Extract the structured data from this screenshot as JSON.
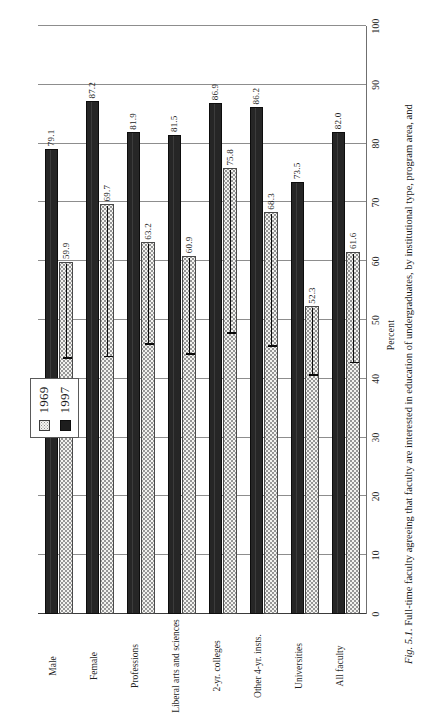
{
  "caption": {
    "fig_number": "Fig. 5.1.",
    "text": "Full-time faculty agreeing that faculty are interested in education of undergraduates, by institutional type, program area, and"
  },
  "legend": {
    "position": "top-center",
    "entries": [
      {
        "label": "1969",
        "swatch": "light-dotted",
        "color": "#f3f3f0"
      },
      {
        "label": "1997",
        "swatch": "solid-black",
        "color": "#262626"
      }
    ]
  },
  "chart_data": {
    "type": "bar",
    "orientation": "horizontal",
    "title": "",
    "xlabel": "",
    "ylabel": "Percent",
    "ylim": [
      0,
      100
    ],
    "ytick_step": 10,
    "grid": true,
    "categories": [
      "All faculty",
      "Universities",
      "Other 4-yr. insts.",
      "2-yr. colleges",
      "Liberal arts and sciences",
      "Professions",
      "Female",
      "Male"
    ],
    "tick_labels": [
      "0",
      "10",
      "20",
      "30",
      "40",
      "50",
      "60",
      "70",
      "80",
      "90",
      "100"
    ],
    "series": [
      {
        "name": "1969",
        "values": [
          61.6,
          52.3,
          68.3,
          75.8,
          60.9,
          63.2,
          69.7,
          59.9
        ]
      },
      {
        "name": "1997",
        "values": [
          82.0,
          73.5,
          86.2,
          86.9,
          81.5,
          81.9,
          87.2,
          79.1
        ]
      }
    ],
    "whisker_ends": [
      42.8,
      40.6,
      45.6,
      47.8,
      44.2,
      45.9,
      43.8,
      43.5
    ]
  }
}
